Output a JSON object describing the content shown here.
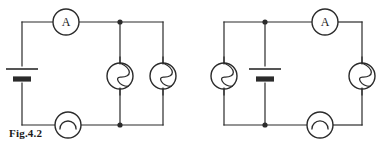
{
  "figure": {
    "caption": "Fig.4.2",
    "background_color": "#ffffff",
    "ink_color": "#2b2b2b",
    "wire_width": 1.2
  },
  "circuits": [
    {
      "id": "left-circuit",
      "name": "circuit-left",
      "frame": {
        "x1": 22,
        "y1": 22,
        "x2": 163,
        "y2": 125
      },
      "junctions": [
        {
          "name": "junction-top",
          "x": 120,
          "y": 22
        },
        {
          "name": "junction-bottom",
          "x": 120,
          "y": 125
        }
      ],
      "branches": [
        {
          "name": "branch-middle",
          "x": 120,
          "y1": 22,
          "y2": 125
        }
      ],
      "components": [
        {
          "name": "ammeter-top",
          "type": "ammeter",
          "label": "A",
          "cx": 66,
          "cy": 22,
          "r": 13,
          "orientation": "horizontal"
        },
        {
          "name": "battery-left",
          "type": "battery",
          "label": "",
          "cx": 22,
          "cy": 75,
          "orientation": "vertical",
          "long_plate_half": 16,
          "short_plate_half": 9
        },
        {
          "name": "lamp-middle",
          "type": "lamp",
          "label": "",
          "cx": 120,
          "cy": 76,
          "r": 13,
          "orientation": "vertical"
        },
        {
          "name": "lamp-right",
          "type": "lamp",
          "label": "",
          "cx": 163,
          "cy": 76,
          "r": 13,
          "orientation": "vertical"
        },
        {
          "name": "bell-bottom",
          "type": "bell",
          "label": "",
          "cx": 68,
          "cy": 125,
          "r": 13,
          "orientation": "horizontal"
        }
      ]
    },
    {
      "id": "right-circuit",
      "name": "circuit-right",
      "frame": {
        "x1": 224,
        "y1": 22,
        "x2": 362,
        "y2": 125
      },
      "junctions": [
        {
          "name": "junction-top",
          "x": 265,
          "y": 22
        },
        {
          "name": "junction-bottom",
          "x": 265,
          "y": 125
        }
      ],
      "branches": [
        {
          "name": "branch-middle",
          "x": 265,
          "y1": 22,
          "y2": 125
        }
      ],
      "components": [
        {
          "name": "ammeter-top",
          "type": "ammeter",
          "label": "A",
          "cx": 325,
          "cy": 22,
          "r": 13,
          "orientation": "horizontal"
        },
        {
          "name": "lamp-left",
          "type": "lamp",
          "label": "",
          "cx": 224,
          "cy": 76,
          "r": 13,
          "orientation": "vertical"
        },
        {
          "name": "battery-middle",
          "type": "battery",
          "label": "",
          "cx": 265,
          "cy": 75,
          "orientation": "vertical",
          "long_plate_half": 16,
          "short_plate_half": 9
        },
        {
          "name": "lamp-right",
          "type": "lamp",
          "label": "",
          "cx": 362,
          "cy": 76,
          "r": 13,
          "orientation": "vertical"
        },
        {
          "name": "bell-bottom",
          "type": "bell",
          "label": "",
          "cx": 320,
          "cy": 125,
          "r": 13,
          "orientation": "horizontal"
        }
      ]
    }
  ]
}
